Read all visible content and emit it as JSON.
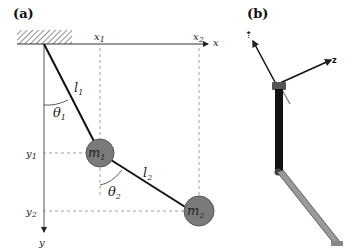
{
  "panels": {
    "a": {
      "label": "(a)",
      "axes": {
        "x_label": "x",
        "y_label": "y"
      },
      "ticks": {
        "x1": "x",
        "x1_sub": "1",
        "x2": "x",
        "x2_sub": "2",
        "y1": "y",
        "y1_sub": "1",
        "y2": "y",
        "y2_sub": "2"
      },
      "links": [
        {
          "name": "l",
          "sub": "1"
        },
        {
          "name": "l",
          "sub": "2"
        }
      ],
      "angles": [
        {
          "name": "θ",
          "sub": "1"
        },
        {
          "name": "θ",
          "sub": "2"
        }
      ],
      "masses": [
        {
          "name": "m",
          "sub": "1"
        },
        {
          "name": "m",
          "sub": "2"
        }
      ],
      "colors": {
        "mass_fill": "#7a7a7a",
        "line": "#111111",
        "guide": "#888888"
      }
    },
    "b": {
      "label": "(b)",
      "colors": {
        "link1": "#111111",
        "link2": "#9a9a9a"
      }
    }
  }
}
